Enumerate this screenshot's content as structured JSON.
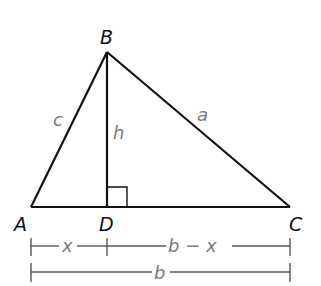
{
  "diagram": {
    "type": "triangle-with-altitude",
    "colors": {
      "line": "#111111",
      "point_label": "#111111",
      "side_label": "#7a7a7a",
      "dimension_line": "#555555"
    },
    "points": {
      "A": {
        "label": "A",
        "x": 31,
        "y": 207
      },
      "B": {
        "label": "B",
        "x": 107,
        "y": 52
      },
      "C": {
        "label": "C",
        "x": 290,
        "y": 207
      },
      "D": {
        "label": "D",
        "x": 107,
        "y": 207
      }
    },
    "sides": {
      "a": "a",
      "c": "c",
      "h": "h"
    },
    "right_angle_at": "D",
    "dimensions": {
      "top": {
        "segment_1_label": "x",
        "segment_2_label": "b − x"
      },
      "bottom": {
        "label": "b"
      }
    }
  }
}
